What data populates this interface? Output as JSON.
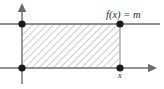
{
  "figure": {
    "type": "math-diagram",
    "background_color": "#ffffff",
    "labels": {
      "function_label": "f(x) = m",
      "x_axis_point_label": "x"
    },
    "colors": {
      "axis": "#6b6b6b",
      "level_line": "#6b6b6b",
      "vertical_edge": "#9a9a9a",
      "hatch": "#8c8c8c",
      "dot": "#1a1a1a",
      "text": "#2a2a2a"
    },
    "geometry": {
      "y_axis_x": 22,
      "x_axis_y": 68,
      "level_line_y": 24,
      "right_edge_x": 120,
      "y_axis_top": 5,
      "y_axis_bottom": 84,
      "x_axis_left": 0,
      "x_axis_right": 156,
      "level_line_left": 0,
      "level_line_right": 160
    },
    "points": [
      {
        "name": "top-left-corner",
        "x": 22,
        "y": 24
      },
      {
        "name": "top-right-corner",
        "x": 120,
        "y": 24
      },
      {
        "name": "bottom-left-origin",
        "x": 22,
        "y": 68
      },
      {
        "name": "bottom-right-corner",
        "x": 120,
        "y": 68
      }
    ],
    "hatching": {
      "direction": "backslash",
      "spacing": 5,
      "angle_deg": -45
    }
  }
}
